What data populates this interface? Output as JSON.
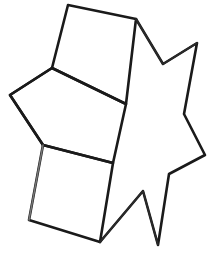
{
  "image": {
    "title": "Hand-drawn line figure",
    "subject": "six-pointed star with overlapping quadrilateral faces",
    "background_color": "#ffffff",
    "ink_color": "#1a1a1a",
    "width": 211,
    "height": 260
  },
  "shapes": {
    "star": {
      "name": "six-pointed-star",
      "stroke_color": "#1a1a1a",
      "points": "68,5 136,19 163,64 197,43 184,114 205,155 169,174 158,245 143,191 100,242 52,200 43,145 10,95 52,68"
    },
    "star_outline": {
      "name": "star-outline-path",
      "d": "M 136,19 L 163,64 L 197,43 L 184,114 L 205,155 L 169,174 L 158,245 L 143,191 L 100,242"
    },
    "quad_top": {
      "name": "upper-quadrilateral",
      "d": "M 68,5 L 136,19 L 126,104 L 52,68 Z"
    },
    "quad_middle": {
      "name": "middle-quadrilateral",
      "d": "M 52,68 L 126,104 L 113,163 L 43,145 L 10,95 Z"
    },
    "quad_bottom": {
      "name": "lower-quadrilateral",
      "d": "M 43,145 L 113,163 L 100,242 L 29,220 Z"
    },
    "star_notch_top": {
      "name": "top-notch-edge",
      "d": "M 136,19 L 163,64 L 197,43"
    },
    "star_notch_bottom": {
      "name": "bottom-notch-edge",
      "d": "M 100,242 L 143,191 L 158,245"
    },
    "left_point": {
      "name": "left-star-point",
      "d": "M 52,68 L 10,95 L 43,145"
    },
    "faint_left_edge": {
      "name": "faint-left-edge",
      "d": "M 43,145 L 29,220"
    }
  }
}
